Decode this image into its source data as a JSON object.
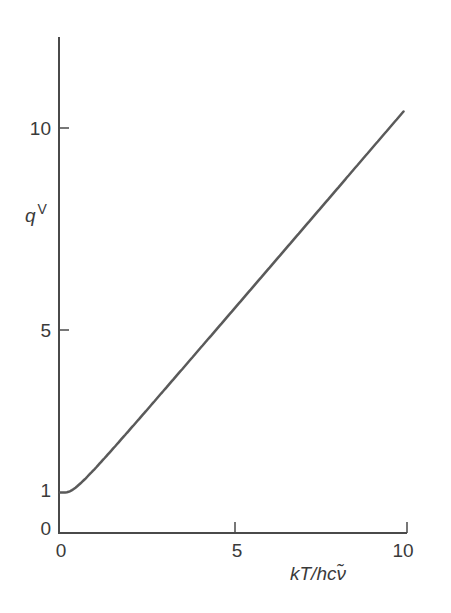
{
  "chart_data": {
    "type": "line",
    "title": "",
    "xlabel": "kT/hcν̃",
    "ylabel": "q",
    "ylabel_superscript": "V",
    "xlim": [
      0,
      10
    ],
    "ylim": [
      0,
      11.5
    ],
    "x_ticks": [
      0,
      5,
      10
    ],
    "y_ticks": [
      0,
      1,
      5,
      10
    ],
    "x_tick_labels": [
      "0",
      "5",
      "10"
    ],
    "y_tick_labels": [
      "0",
      "1",
      "5",
      "10"
    ],
    "grid": false,
    "legend": null,
    "series": [
      {
        "name": "q^V",
        "color": "#5a5a5a",
        "x": [
          0,
          0.1,
          0.2,
          0.3,
          0.5,
          0.75,
          1,
          1.5,
          2,
          3,
          4,
          5,
          6,
          7,
          8,
          9,
          9.9
        ],
        "values": [
          1.0,
          1.0,
          1.01,
          1.04,
          1.16,
          1.36,
          1.58,
          2.05,
          2.54,
          3.53,
          4.52,
          5.52,
          6.51,
          7.51,
          8.51,
          9.51,
          10.4
        ]
      }
    ]
  },
  "colors": {
    "axis": "#4a4a4a",
    "curve": "#5a5a5a",
    "text": "#3a3a3a"
  }
}
